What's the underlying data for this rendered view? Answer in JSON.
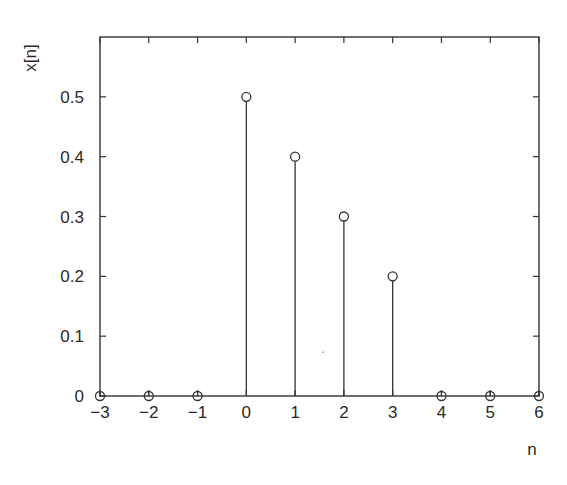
{
  "chart_data": {
    "type": "stem",
    "title": "",
    "xlabel": "n",
    "ylabel": "x[n]",
    "x": [
      -3,
      -2,
      -1,
      0,
      1,
      2,
      3,
      4,
      5,
      6
    ],
    "values": [
      0,
      0,
      0,
      0.5,
      0.4,
      0.3,
      0.2,
      0,
      0,
      0
    ],
    "xlim": [
      -3,
      6
    ],
    "ylim": [
      0,
      0.6
    ],
    "xticks": [
      -3,
      -2,
      -1,
      0,
      1,
      2,
      3,
      4,
      5,
      6
    ],
    "xtick_labels": [
      "−3",
      "−2",
      "−1",
      "0",
      "1",
      "2",
      "3",
      "4",
      "5",
      "6"
    ],
    "yticks": [
      0,
      0.1,
      0.2,
      0.3,
      0.4,
      0.5
    ],
    "ytick_labels": [
      "0",
      "0.1",
      "0.2",
      "0.3",
      "0.4",
      "0.5"
    ],
    "grid": false,
    "legend": null,
    "marker": "open-circle",
    "line_color": "#333333"
  }
}
